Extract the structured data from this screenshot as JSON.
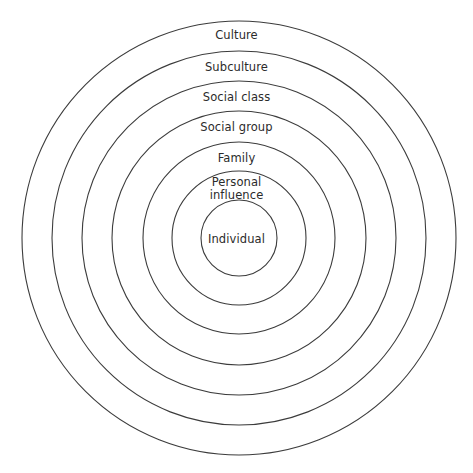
{
  "diagram": {
    "type": "concentric-circles",
    "background_color": "#ffffff",
    "stroke_color": "#3c3c3c",
    "text_color": "#2b2b2b",
    "center": {
      "x": 239,
      "y": 238
    },
    "rings": [
      {
        "id": "culture",
        "label": "Culture",
        "level": 1,
        "radius": 217,
        "label_y": 29
      },
      {
        "id": "subculture",
        "label": "Subculture",
        "level": 2,
        "radius": 187,
        "label_y": 61
      },
      {
        "id": "social-class",
        "label": "Social class",
        "level": 3,
        "radius": 157,
        "label_y": 91
      },
      {
        "id": "social-group",
        "label": "Social group",
        "level": 4,
        "radius": 127,
        "label_y": 121
      },
      {
        "id": "family",
        "label": "Family",
        "level": 5,
        "radius": 96,
        "label_y": 152
      },
      {
        "id": "personal-influence",
        "label": "Personal\ninfluence",
        "level": 6,
        "radius": 67,
        "label_y": 176
      },
      {
        "id": "individual",
        "label": "Individual",
        "level": 7,
        "radius": 38,
        "label_y": 233
      }
    ]
  }
}
